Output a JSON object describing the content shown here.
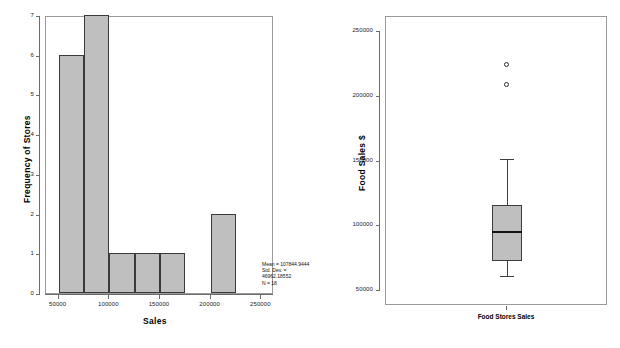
{
  "chart_data": [
    {
      "type": "bar",
      "id": "histogram",
      "title": "",
      "xlabel": "Sales",
      "ylabel": "Frequency of Stores",
      "xlim": [
        37500,
        262500
      ],
      "ylim": [
        0,
        7
      ],
      "grid": false,
      "legend": "none",
      "xticks": [
        "50000",
        "100000",
        "150000",
        "200000",
        "250000"
      ],
      "xtick_values": [
        50000,
        100000,
        150000,
        200000,
        250000
      ],
      "yticks": [
        "0",
        "1",
        "2",
        "3",
        "4",
        "5",
        "6",
        "7"
      ],
      "ytick_values": [
        0,
        1,
        2,
        3,
        4,
        5,
        6,
        7
      ],
      "bin_width": 25000,
      "categories": [
        "50000-75000",
        "75000-100000",
        "100000-125000",
        "125000-150000",
        "150000-175000",
        "175000-200000",
        "200000-225000"
      ],
      "bin_edges": [
        50000,
        75000,
        100000,
        125000,
        150000,
        175000,
        200000,
        225000
      ],
      "values": [
        6,
        7,
        1,
        1,
        1,
        0,
        2
      ],
      "bar_fill": "#bfbfbf",
      "bar_edge": "#3a3a3a",
      "annotation": {
        "line1": "Mean = 107844.9444",
        "line2": "Std. Dev. =",
        "line3": "46962.18552",
        "line4": "N = 18"
      },
      "stats": {
        "mean": 107844.9444,
        "std_dev": 46962.18552,
        "n": 18
      }
    },
    {
      "type": "box",
      "id": "boxplot",
      "title": "",
      "xlabel": "",
      "ylabel": "Food Sales $",
      "ylim": [
        38000,
        262000
      ],
      "grid": false,
      "legend": "none",
      "yticks": [
        "50000",
        "100000",
        "150000",
        "200000",
        "250000"
      ],
      "ytick_values": [
        50000,
        100000,
        150000,
        200000,
        250000
      ],
      "categories": [
        "Food Stores Sales"
      ],
      "box": {
        "label": "Food Stores Sales",
        "whisker_low": 61000,
        "q1": 73000,
        "median": 95500,
        "q3": 116500,
        "whisker_high": 152000,
        "outliers": [
          225000,
          209500
        ]
      },
      "box_fill": "#bfbfbf",
      "box_edge": "#3d3d3d",
      "median_color": "#111111"
    }
  ],
  "histogram": {
    "xlabel": "Sales",
    "ylabel": "Frequency of Stores"
  },
  "boxplot": {
    "ylabel": "Food Sales $",
    "category_label": "Food Stores Sales"
  },
  "colors": {
    "fill": "#bfbfbf",
    "edge": "#3a3a3a",
    "frame": "#9a9a9a",
    "axis": "#6b6b6b",
    "text": "#000000"
  }
}
